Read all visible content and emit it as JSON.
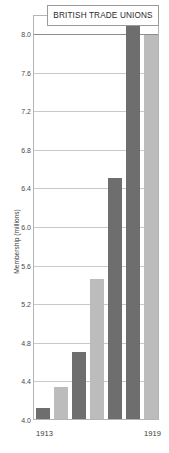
{
  "title": "BRITISH TRADE UNIONS",
  "axis": {
    "y_label": "Membership (millions)",
    "y_ticks": [
      "8.0",
      "7.6",
      "7.2",
      "6.8",
      "6.4",
      "6.0",
      "5.6",
      "5.2",
      "4.8",
      "4.4",
      "4.0"
    ],
    "x_first": "1913",
    "x_last": "1919"
  },
  "colors": {
    "bar_dark": "#6e6e6e",
    "bar_light": "#bcbcbc",
    "gridline": "#c9c9c9",
    "frame": "#b4b4b4",
    "title_border": "#9a9a9a",
    "text": "#3a3a3a",
    "background": "#ffffff"
  },
  "chart_data": {
    "type": "bar",
    "title": "BRITISH TRADE UNIONS",
    "xlabel": "",
    "ylabel": "Membership (millions)",
    "ylim": [
      4.0,
      8.0
    ],
    "ytick_step": 0.4,
    "grid": true,
    "legend": "none",
    "categories": [
      "1913",
      "1914",
      "1915",
      "1916",
      "1917",
      "1918",
      "1919"
    ],
    "values": [
      4.13,
      4.35,
      4.72,
      5.47,
      6.52,
      8.35,
      8.0
    ],
    "bar_colors": [
      "#6e6e6e",
      "#bcbcbc",
      "#6e6e6e",
      "#bcbcbc",
      "#6e6e6e",
      "#6e6e6e",
      "#bcbcbc"
    ]
  }
}
